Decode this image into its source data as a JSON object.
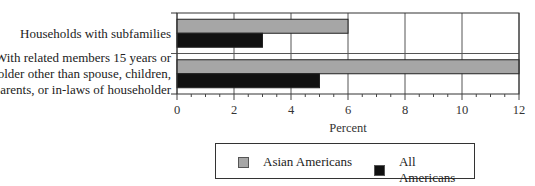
{
  "chart_data": {
    "type": "bar",
    "orientation": "horizontal",
    "title": "",
    "xlabel": "Percent",
    "ylabel": "",
    "xlim": [
      0,
      12
    ],
    "x_ticks": [
      0,
      2,
      4,
      6,
      8,
      10,
      12
    ],
    "x_tick_labels": [
      "0",
      "2",
      "4",
      "6",
      "8",
      "10",
      "12"
    ],
    "minor_tick_step": 0.5,
    "grid": true,
    "legend_position": "bottom",
    "categories": [
      [
        "Households with subfamilies"
      ],
      [
        "With related members 15 years or",
        "older other than spouse, children,",
        "parents, or in-laws of householder"
      ]
    ],
    "series": [
      {
        "name": "Asian Americans",
        "color": "#a6a6a6",
        "values": [
          6,
          12
        ]
      },
      {
        "name": "All Americans",
        "color": "#111111",
        "values": [
          3,
          5
        ]
      }
    ]
  },
  "legend": {
    "items": [
      {
        "label": "Asian Americans",
        "color": "#a6a6a6"
      },
      {
        "label": "All Americans",
        "color": "#111111"
      }
    ]
  }
}
